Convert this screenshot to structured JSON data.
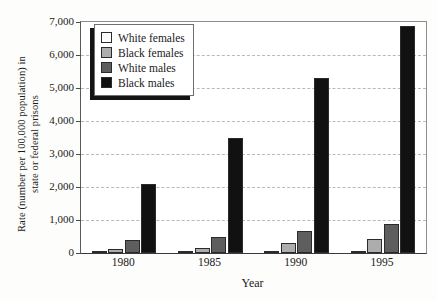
{
  "chart_data": {
    "type": "bar",
    "title": "",
    "subtitle": "",
    "xlabel": "Year",
    "ylabel": "Rate (number per 100,000 population) in state or federal prisons",
    "ylabel_line1": "Rate (number per 100,000 population) in",
    "ylabel_line2": "state or federal prisons",
    "categories": [
      "1980",
      "1985",
      "1990",
      "1995"
    ],
    "series": [
      {
        "name": "White females",
        "color": "#ffffff",
        "values": [
          12,
          20,
          25,
          70
        ]
      },
      {
        "name": "Black females",
        "color": "#adadad",
        "values": [
          120,
          165,
          310,
          410
        ]
      },
      {
        "name": "White males",
        "color": "#5e5e5e",
        "values": [
          395,
          495,
          680,
          880
        ]
      },
      {
        "name": "Black males",
        "color": "#111111",
        "values": [
          2090,
          3500,
          5300,
          6880
        ]
      }
    ],
    "ylim": [
      0,
      7000
    ],
    "ytick_values": [
      0,
      1000,
      2000,
      3000,
      4000,
      5000,
      6000,
      7000
    ],
    "ytick_labels": [
      "0",
      "1,000",
      "2,000",
      "3,000",
      "4,000",
      "5,000",
      "6,000",
      "7,000"
    ],
    "grid": true,
    "grid_style": "dashed-horizontal",
    "legend_position": "top-left-inside",
    "legend_entries": [
      "White females",
      "Black females",
      "White males",
      "Black males"
    ]
  }
}
